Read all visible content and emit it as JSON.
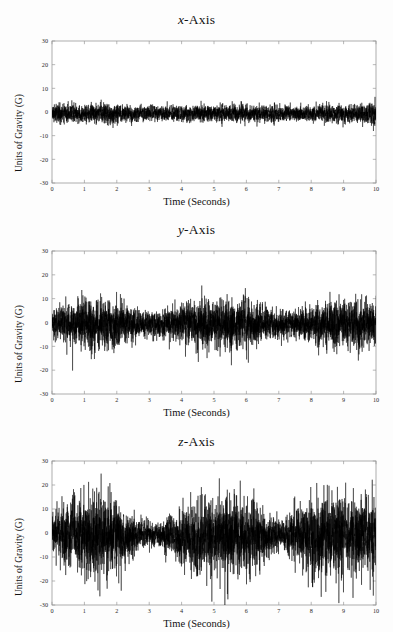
{
  "figure": {
    "background_color": "#fdfdfd",
    "trace_color": "#000000",
    "axis_color": "#9a9a9a"
  },
  "panels": [
    {
      "id": "x",
      "title_prefix": "x",
      "title_suffix": "-Axis",
      "title_full": "x-Axis",
      "xlabel": "Time (Seconds)",
      "ylabel": "Units of Gravity (G)"
    },
    {
      "id": "y",
      "title_prefix": "y",
      "title_suffix": "-Axis",
      "title_full": "y-Axis",
      "xlabel": "Time (Seconds)",
      "ylabel": "Units of Gravity (G)"
    },
    {
      "id": "z",
      "title_prefix": "z",
      "title_suffix": "-Axis",
      "title_full": "z-Axis",
      "xlabel": "Time (Seconds)",
      "ylabel": "Units of Gravity (G)"
    }
  ],
  "chart_data": [
    {
      "type": "line",
      "title": "x-Axis",
      "xlabel": "Time (Seconds)",
      "ylabel": "Units of Gravity (G)",
      "xlim": [
        0,
        10
      ],
      "ylim": [
        -30,
        30
      ],
      "xticks": [
        0,
        1,
        2,
        3,
        4,
        5,
        6,
        7,
        8,
        9,
        10
      ],
      "xtick_labels": [
        "0",
        "1",
        "2",
        "3",
        "4",
        "5",
        "6",
        "7",
        "8",
        "9",
        "10"
      ],
      "yticks": [
        -30,
        -20,
        -10,
        0,
        10,
        20,
        30
      ],
      "ytick_labels": [
        "-30",
        "-20",
        "-10",
        "0",
        "10",
        "20",
        "30"
      ],
      "grid": false,
      "legend": null,
      "series": [
        {
          "name": "x-axis acceleration",
          "description": "Dense high-frequency vibration noise forming a narrow band centred just below 0 G, nearly uniform across the full 10 s record.",
          "mean": -0.6,
          "envelope_upper_typical": 3.0,
          "envelope_lower_typical": -4.0,
          "peak_max": 6.0,
          "peak_min": -7.0,
          "seed": 11,
          "noise_base": 2.4,
          "burst_gain": 0.35,
          "envelope_nodes": [
            {
              "t": 0.0,
              "a": 1.05
            },
            {
              "t": 0.6,
              "a": 1.0
            },
            {
              "t": 1.2,
              "a": 1.05
            },
            {
              "t": 1.9,
              "a": 1.15
            },
            {
              "t": 2.4,
              "a": 0.95
            },
            {
              "t": 3.2,
              "a": 0.85
            },
            {
              "t": 4.0,
              "a": 0.9
            },
            {
              "t": 4.6,
              "a": 1.0
            },
            {
              "t": 5.2,
              "a": 1.0
            },
            {
              "t": 6.0,
              "a": 0.95
            },
            {
              "t": 6.8,
              "a": 0.9
            },
            {
              "t": 7.3,
              "a": 0.8
            },
            {
              "t": 8.0,
              "a": 0.95
            },
            {
              "t": 8.8,
              "a": 1.0
            },
            {
              "t": 9.5,
              "a": 1.0
            },
            {
              "t": 10.0,
              "a": 1.25
            }
          ]
        }
      ]
    },
    {
      "type": "line",
      "title": "y-Axis",
      "xlabel": "Time (Seconds)",
      "ylabel": "Units of Gravity (G)",
      "xlim": [
        0,
        10
      ],
      "ylim": [
        -30,
        30
      ],
      "xticks": [
        0,
        1,
        2,
        3,
        4,
        5,
        6,
        7,
        8,
        9,
        10
      ],
      "xtick_labels": [
        "0",
        "1",
        "2",
        "3",
        "4",
        "5",
        "6",
        "7",
        "8",
        "9",
        "10"
      ],
      "yticks": [
        -30,
        -20,
        -10,
        0,
        10,
        20,
        30
      ],
      "ytick_labels": [
        "-30",
        "-20",
        "-10",
        "0",
        "10",
        "20",
        "30"
      ],
      "grid": false,
      "legend": null,
      "series": [
        {
          "name": "y-axis acceleration",
          "description": "Noise band centred near 0 G with intermittent bursts; largest excursions near 1-2 s, 4.5-6 s and 8.5-10 s, quietest around 3 s and 7 s.",
          "mean": -0.5,
          "envelope_upper_typical": 8.0,
          "envelope_lower_typical": -9.0,
          "peak_max": 14.0,
          "peak_min": -13.0,
          "seed": 27,
          "noise_base": 4.4,
          "burst_gain": 1.0,
          "envelope_nodes": [
            {
              "t": 0.0,
              "a": 0.85
            },
            {
              "t": 0.5,
              "a": 1.15
            },
            {
              "t": 1.0,
              "a": 1.45
            },
            {
              "t": 1.5,
              "a": 1.55
            },
            {
              "t": 2.0,
              "a": 1.3
            },
            {
              "t": 2.5,
              "a": 0.95
            },
            {
              "t": 3.0,
              "a": 0.7
            },
            {
              "t": 3.5,
              "a": 0.85
            },
            {
              "t": 4.0,
              "a": 1.15
            },
            {
              "t": 4.6,
              "a": 1.45
            },
            {
              "t": 5.2,
              "a": 1.35
            },
            {
              "t": 5.8,
              "a": 1.5
            },
            {
              "t": 6.3,
              "a": 1.2
            },
            {
              "t": 6.9,
              "a": 0.85
            },
            {
              "t": 7.4,
              "a": 0.8
            },
            {
              "t": 8.0,
              "a": 1.05
            },
            {
              "t": 8.6,
              "a": 1.35
            },
            {
              "t": 9.2,
              "a": 1.5
            },
            {
              "t": 9.7,
              "a": 1.45
            },
            {
              "t": 10.0,
              "a": 1.3
            }
          ]
        }
      ]
    },
    {
      "type": "line",
      "title": "z-Axis",
      "xlabel": "Time (Seconds)",
      "ylabel": "Units of Gravity (G)",
      "xlim": [
        0,
        10
      ],
      "ylim": [
        -30,
        30
      ],
      "xticks": [
        0,
        1,
        2,
        3,
        4,
        5,
        6,
        7,
        8,
        9,
        10
      ],
      "xtick_labels": [
        "0",
        "1",
        "2",
        "3",
        "4",
        "5",
        "6",
        "7",
        "8",
        "9",
        "10"
      ],
      "yticks": [
        -30,
        -20,
        -10,
        0,
        10,
        20,
        30
      ],
      "ytick_labels": [
        "-30",
        "-20",
        "-10",
        "0",
        "10",
        "20",
        "30"
      ],
      "grid": false,
      "legend": null,
      "series": [
        {
          "name": "z-axis acceleration",
          "description": "Largest amplitude of the three channels; heavy downward spikes toward -20 G around 1-2 s, 4-6 s and 8-10 s, with a quiet interval near 2.5-3.5 s and a brief lull near 7 s.",
          "mean": -0.8,
          "envelope_upper_typical": 10.0,
          "envelope_lower_typical": -14.0,
          "peak_max": 16.0,
          "peak_min": -23.0,
          "seed": 43,
          "noise_base": 5.6,
          "burst_gain": 1.35,
          "envelope_nodes": [
            {
              "t": 0.0,
              "a": 1.0
            },
            {
              "t": 0.4,
              "a": 1.35
            },
            {
              "t": 0.9,
              "a": 1.7
            },
            {
              "t": 1.4,
              "a": 1.95
            },
            {
              "t": 1.9,
              "a": 1.8
            },
            {
              "t": 2.3,
              "a": 1.2
            },
            {
              "t": 2.7,
              "a": 0.65
            },
            {
              "t": 3.2,
              "a": 0.55
            },
            {
              "t": 3.7,
              "a": 0.85
            },
            {
              "t": 4.2,
              "a": 1.5
            },
            {
              "t": 4.7,
              "a": 1.75
            },
            {
              "t": 5.2,
              "a": 1.6
            },
            {
              "t": 5.7,
              "a": 1.85
            },
            {
              "t": 6.2,
              "a": 1.55
            },
            {
              "t": 6.7,
              "a": 1.0
            },
            {
              "t": 7.1,
              "a": 0.7
            },
            {
              "t": 7.6,
              "a": 1.2
            },
            {
              "t": 8.1,
              "a": 1.75
            },
            {
              "t": 8.6,
              "a": 1.9
            },
            {
              "t": 9.1,
              "a": 1.7
            },
            {
              "t": 9.6,
              "a": 1.85
            },
            {
              "t": 10.0,
              "a": 1.6
            }
          ]
        }
      ]
    }
  ]
}
